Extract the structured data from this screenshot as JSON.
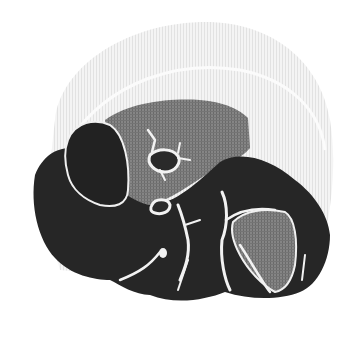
{
  "image": {
    "subject": "grayscale halftone anatomical illustration of a heart",
    "width": 361,
    "height": 340,
    "colors": {
      "background": "#ffffff",
      "halo": "#ececec",
      "halo_line": "#fafafa",
      "dark_tissue": "#262626",
      "mid_gray_region": "#7a7a7a",
      "vessels": "#f2f2f2"
    },
    "regions": [
      {
        "name": "outer-halo",
        "shade": "light-gray halftone"
      },
      {
        "name": "upper-gray-chamber",
        "shade": "mid-gray"
      },
      {
        "name": "left-dark-lobe",
        "shade": "dark"
      },
      {
        "name": "main-dark-body",
        "shade": "dark"
      },
      {
        "name": "right-gray-chamber",
        "shade": "mid-gray"
      },
      {
        "name": "coronary-vessels",
        "shade": "white lines"
      }
    ]
  }
}
